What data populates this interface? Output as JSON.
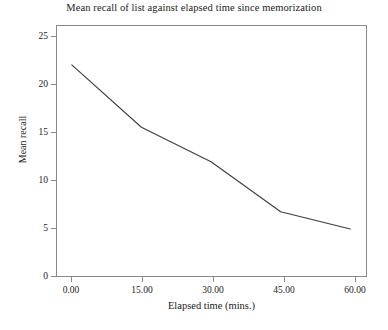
{
  "chart_data": {
    "type": "line",
    "title": "Mean recall of list against elapsed time since memorization",
    "xlabel": "Elapsed time (mins.)",
    "ylabel": "Mean recall",
    "x": [
      0,
      15,
      30,
      45,
      60
    ],
    "values": [
      22.1,
      15.6,
      12.0,
      6.8,
      5.0
    ],
    "xtick_labels": [
      "0.00",
      "15.00",
      "30.00",
      "45.00",
      "60.00"
    ],
    "ytick_labels": [
      "0",
      "5",
      "10",
      "15",
      "20",
      "25"
    ],
    "ytick_values": [
      0,
      5,
      10,
      15,
      20,
      25
    ],
    "xlim": [
      -3.4,
      63.6
    ],
    "ylim": [
      0,
      26.25
    ],
    "grid": false,
    "legend": false,
    "line_color": "#3c3c3c",
    "frame_color": "#8a8a8a",
    "background": "#ffffff"
  }
}
